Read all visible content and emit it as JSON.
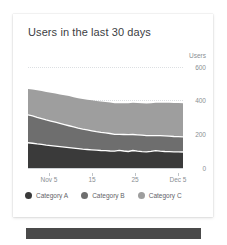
{
  "card": {
    "title": "Users in the last 30 days"
  },
  "axes": {
    "y_unit_label": "Users",
    "y_ticks": [
      "600",
      "400",
      "200",
      "0"
    ],
    "x_ticks": [
      "Nov 5",
      "15",
      "25",
      "Dec 5"
    ]
  },
  "legend": {
    "items": [
      {
        "label": "Category A",
        "color": "#3a3a3a"
      },
      {
        "label": "Category B",
        "color": "#6e6e6e"
      },
      {
        "label": "Category C",
        "color": "#9e9e9e"
      }
    ]
  },
  "colors": {
    "category_a": "#3a3a3a",
    "category_b": "#6e6e6e",
    "category_c": "#9e9e9e",
    "separator": "#ffffff",
    "gridline": "#dcdfe2",
    "axis_text": "#8a8f94",
    "title_text": "#3c4043",
    "bottom_bar": "#4a4a4a"
  },
  "chart_data": {
    "type": "area",
    "stacked": true,
    "title": "Users in the last 30 days",
    "xlabel": "",
    "ylabel": "Users",
    "ylim": [
      0,
      600
    ],
    "yticks": [
      0,
      200,
      400,
      600
    ],
    "grid": true,
    "legend_position": "bottom",
    "x": [
      "Nov 1",
      "Nov 2",
      "Nov 3",
      "Nov 4",
      "Nov 5",
      "Nov 6",
      "Nov 7",
      "Nov 8",
      "Nov 9",
      "Nov 10",
      "Nov 11",
      "Nov 12",
      "Nov 13",
      "Nov 14",
      "Nov 15",
      "Nov 16",
      "Nov 17",
      "Nov 18",
      "Nov 19",
      "Nov 20",
      "Nov 21",
      "Nov 22",
      "Nov 23",
      "Nov 24",
      "Nov 25",
      "Nov 26",
      "Nov 27",
      "Nov 28",
      "Nov 29",
      "Nov 30",
      "Dec 1",
      "Dec 2",
      "Dec 3",
      "Dec 4",
      "Dec 5"
    ],
    "xtick_labels": [
      "Nov 5",
      "15",
      "25",
      "Dec 5"
    ],
    "xtick_indices": [
      4,
      14,
      24,
      34
    ],
    "series": [
      {
        "name": "Category A",
        "color": "#3a3a3a",
        "values": [
          150,
          147,
          143,
          140,
          136,
          133,
          130,
          127,
          124,
          121,
          118,
          115,
          112,
          110,
          108,
          106,
          104,
          103,
          101,
          100,
          105,
          101,
          98,
          104,
          100,
          97,
          96,
          99,
          103,
          100,
          98,
          97,
          96,
          96,
          95
        ]
      },
      {
        "name": "Category B",
        "color": "#6e6e6e",
        "values": [
          165,
          162,
          158,
          154,
          150,
          146,
          142,
          138,
          134,
          130,
          126,
          122,
          119,
          116,
          113,
          110,
          108,
          106,
          104,
          100,
          95,
          98,
          100,
          95,
          97,
          98,
          96,
          93,
          89,
          92,
          93,
          92,
          91,
          90,
          90
        ]
      },
      {
        "name": "Category C",
        "color": "#9e9e9e",
        "values": [
          155,
          158,
          161,
          163,
          166,
          168,
          170,
          172,
          174,
          176,
          177,
          178,
          179,
          180,
          181,
          182,
          183,
          183,
          184,
          185,
          185,
          186,
          187,
          188,
          189,
          190,
          191,
          193,
          195,
          196,
          197,
          198,
          199,
          200,
          200
        ]
      }
    ],
    "totals": [
      470,
      467,
      462,
      457,
      452,
      447,
      442,
      437,
      432,
      427,
      421,
      415,
      410,
      406,
      402,
      398,
      395,
      392,
      389,
      385,
      385,
      385,
      385,
      387,
      386,
      385,
      383,
      385,
      387,
      388,
      388,
      387,
      386,
      386,
      385
    ]
  }
}
